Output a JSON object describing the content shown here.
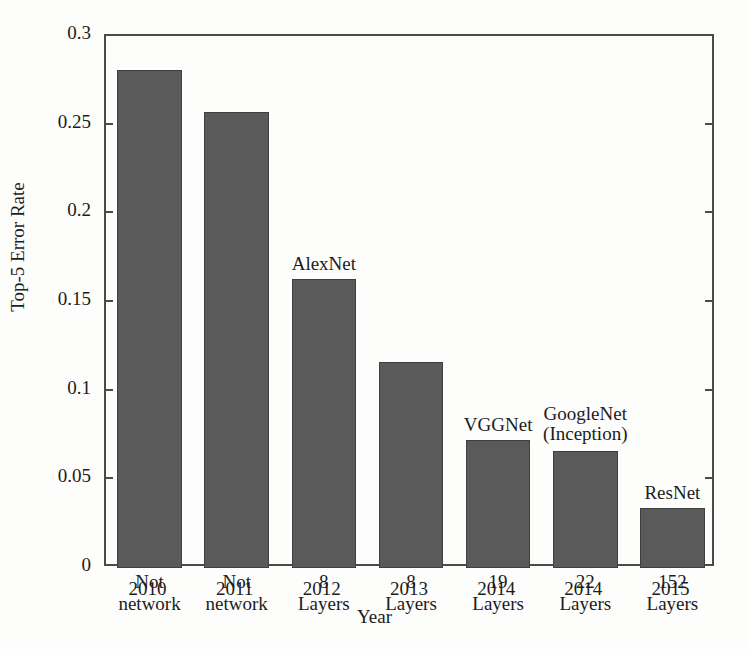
{
  "chart_data": {
    "type": "bar",
    "title": "",
    "xlabel": "Year",
    "ylabel": "Top-5 Error Rate",
    "categories": [
      "2010",
      "2011",
      "2012",
      "2013",
      "2014",
      "2014",
      "2015"
    ],
    "values": [
      0.281,
      0.257,
      0.163,
      0.116,
      0.072,
      0.066,
      0.034
    ],
    "ylim": [
      0,
      0.3
    ],
    "yticks": [
      "0",
      "0.05",
      "0.1",
      "0.15",
      "0.2",
      "0.25",
      "0.3"
    ],
    "ytick_values": [
      0,
      0.05,
      0.1,
      0.15,
      0.2,
      0.25,
      0.3
    ],
    "grid": false,
    "legend": "none",
    "bar_color": "#5a5a5a",
    "bar_edge_color": "#3f3f3f",
    "axis_color": "#4a4a4a",
    "point_annotations": [
      {
        "category": "2010",
        "top_label": [
          "",
          ""
        ],
        "inner_label": [
          "Not",
          "network"
        ]
      },
      {
        "category": "2011",
        "top_label": [
          "",
          ""
        ],
        "inner_label": [
          "Not",
          "network"
        ]
      },
      {
        "category": "2012",
        "top_label": [
          "AlexNet"
        ],
        "inner_label": [
          "8",
          "Layers"
        ]
      },
      {
        "category": "2013",
        "top_label": [
          ""
        ],
        "inner_label": [
          "8",
          "Layers"
        ]
      },
      {
        "category": "2014",
        "top_label": [
          "VGGNet"
        ],
        "inner_label": [
          "19",
          "Layers"
        ]
      },
      {
        "category": "2014",
        "top_label": [
          "GoogleNet",
          "(Inception)"
        ],
        "inner_label": [
          "22",
          "Layers"
        ]
      },
      {
        "category": "2015",
        "top_label": [
          "ResNet"
        ],
        "inner_label": [
          "152",
          "Layers"
        ]
      }
    ]
  },
  "bars": [
    {
      "year": "2010",
      "value": 0.281,
      "network_name": "",
      "network_name_line2": "",
      "depth_line1": "Not",
      "depth_line2": "network"
    },
    {
      "year": "2011",
      "value": 0.257,
      "network_name": "",
      "network_name_line2": "",
      "depth_line1": "Not",
      "depth_line2": "network"
    },
    {
      "year": "2012",
      "value": 0.163,
      "network_name": "AlexNet",
      "network_name_line2": "",
      "depth_line1": "8",
      "depth_line2": "Layers"
    },
    {
      "year": "2013",
      "value": 0.116,
      "network_name": "",
      "network_name_line2": "",
      "depth_line1": "8",
      "depth_line2": "Layers"
    },
    {
      "year": "2014",
      "value": 0.072,
      "network_name": "VGGNet",
      "network_name_line2": "",
      "depth_line1": "19",
      "depth_line2": "Layers"
    },
    {
      "year": "2014",
      "value": 0.066,
      "network_name": "GoogleNet",
      "network_name_line2": "(Inception)",
      "depth_line1": "22",
      "depth_line2": "Layers"
    },
    {
      "year": "2015",
      "value": 0.034,
      "network_name": "ResNet",
      "network_name_line2": "",
      "depth_line1": "152",
      "depth_line2": "Layers"
    }
  ],
  "axes": {
    "y_title": "Top-5 Error Rate",
    "x_title": "Year",
    "y_ticks": [
      {
        "label": "0.3",
        "value": 0.3
      },
      {
        "label": "0.25",
        "value": 0.25
      },
      {
        "label": "0.2",
        "value": 0.2
      },
      {
        "label": "0.15",
        "value": 0.15
      },
      {
        "label": "0.1",
        "value": 0.1
      },
      {
        "label": "0.05",
        "value": 0.05
      },
      {
        "label": "0",
        "value": 0
      }
    ]
  }
}
